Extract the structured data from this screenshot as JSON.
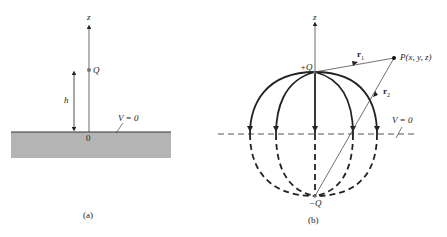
{
  "panel_a": {
    "caption": "(a)",
    "axis_label": "z",
    "charge_label": "Q",
    "height_label": "h",
    "origin_label": "0",
    "plane_label": "V = 0"
  },
  "panel_b": {
    "caption": "(b)",
    "axis_label": "z",
    "pos_charge_label": "+Q",
    "neg_charge_label": "−Q",
    "point_label": "P(x, y, z)",
    "r1_label": "r",
    "r1_sub": "1",
    "r2_label": "r",
    "r2_sub": "2",
    "plane_label": "V = 0"
  },
  "colors": {
    "ground": "#b4b4b4",
    "ink": "#222222"
  }
}
